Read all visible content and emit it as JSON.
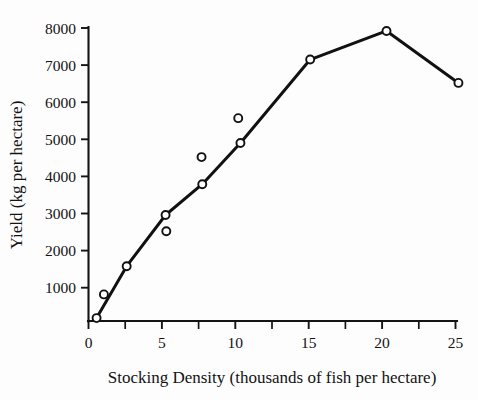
{
  "figure": {
    "background_color": "#fdfdfd",
    "ink_color": "#111111",
    "xlabel": "Stocking Density (thousands of fish per hectare)",
    "ylabel": "Yield (kg per hectare)"
  },
  "chart_data": {
    "type": "line",
    "title": "",
    "xlabel": "Stocking Density (thousands of fish per hectare)",
    "ylabel": "Yield (kg per hectare)",
    "xlim": [
      0,
      25.8
    ],
    "ylim": [
      0,
      8000
    ],
    "grid": false,
    "legend": null,
    "x_ticks_major": [
      0,
      5,
      10,
      15,
      20,
      25
    ],
    "x_tick_labels": [
      "0",
      "5",
      "10",
      "15",
      "20",
      "25"
    ],
    "x_ticks_minor": [
      2.5,
      7.5,
      12.5,
      17.5,
      22.5
    ],
    "y_ticks_major": [
      1000,
      2000,
      3000,
      4000,
      5000,
      6000,
      7000,
      8000
    ],
    "y_tick_labels": [
      "1000",
      "2000",
      "3000",
      "4000",
      "5000",
      "6000",
      "7000",
      "8000"
    ],
    "marker_style": "open-circle",
    "series": [
      {
        "name": "Yield response",
        "connected": true,
        "points": [
          {
            "x": 0.55,
            "y": 180
          },
          {
            "x": 2.6,
            "y": 1580
          },
          {
            "x": 5.25,
            "y": 2960
          },
          {
            "x": 7.75,
            "y": 3790
          },
          {
            "x": 10.35,
            "y": 4900
          },
          {
            "x": 15.1,
            "y": 7150
          },
          {
            "x": 20.3,
            "y": 7920
          },
          {
            "x": 25.2,
            "y": 6520
          }
        ]
      },
      {
        "name": "Replicate observations",
        "connected": false,
        "points": [
          {
            "x": 1.05,
            "y": 820
          },
          {
            "x": 5.3,
            "y": 2520
          },
          {
            "x": 7.7,
            "y": 4520
          },
          {
            "x": 10.2,
            "y": 5570
          }
        ]
      }
    ]
  }
}
